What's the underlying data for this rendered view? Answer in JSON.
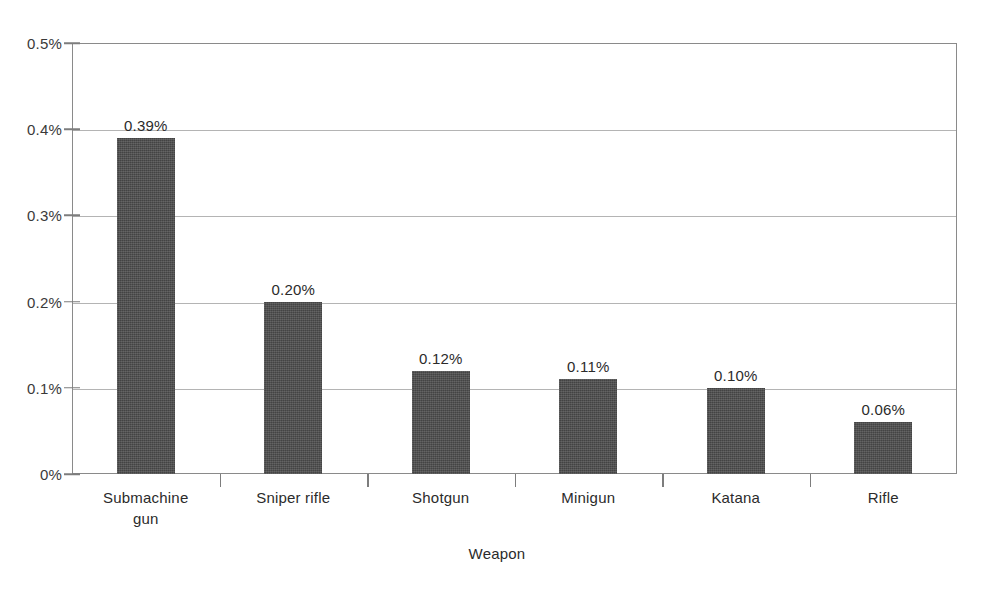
{
  "chart_data": {
    "type": "bar",
    "title": "",
    "subtitle": "",
    "xlabel": "Weapon",
    "ylabel": "",
    "categories": [
      "Submachine\ngun",
      "Sniper rifle",
      "Shotgun",
      "Minigun",
      "Katana",
      "Rifle"
    ],
    "values": [
      0.39,
      0.2,
      0.12,
      0.11,
      0.1,
      0.06
    ],
    "value_labels": [
      "0.39%",
      "0.20%",
      "0.12%",
      "0.11%",
      "0.10%",
      "0.06%"
    ],
    "ylim": [
      0,
      0.5
    ],
    "y_ticks": [
      0,
      0.1,
      0.2,
      0.3,
      0.4,
      0.5
    ],
    "y_tick_labels": [
      "0%",
      "0.1%",
      "0.2%",
      "0.3%",
      "0.4%",
      "0.5%"
    ],
    "grid": true,
    "grid_axis": "y",
    "legend": false,
    "legend_position": "none",
    "units": "percent",
    "bar_color": "#4d4d4d",
    "grid_color": "#b4b4b4",
    "axis_color": "#8a8a8a",
    "background_color": "#ffffff"
  }
}
